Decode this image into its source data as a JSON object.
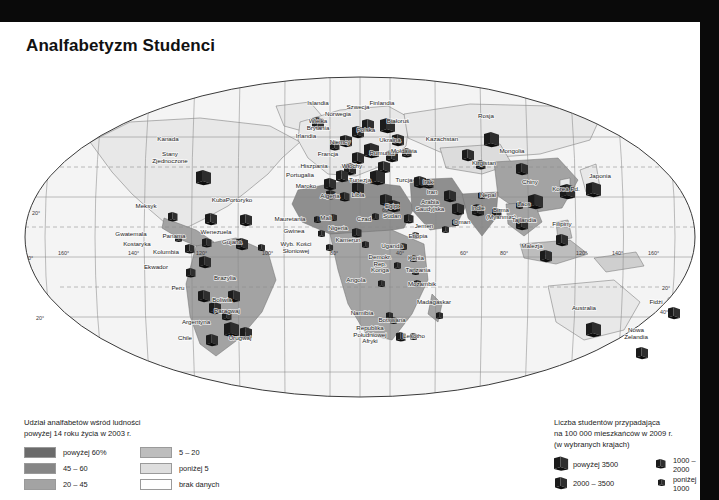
{
  "title": "Analfabetyzm\nStudenci",
  "legend_left": {
    "heading": "Udział analfabetów wśród ludności\npowyżej 14 roku życia w 2003 r.",
    "items": [
      {
        "label": "powyżej 60%",
        "color": "#6b6b6b"
      },
      {
        "label": "45 – 60",
        "color": "#868686"
      },
      {
        "label": "20 – 45",
        "color": "#a3a3a3"
      },
      {
        "label": "5 – 20",
        "color": "#bdbdbd"
      },
      {
        "label": "poniżej 5",
        "color": "#dedede"
      },
      {
        "label": "brak danych",
        "color": "#ffffff"
      }
    ]
  },
  "legend_right": {
    "heading": "Liczba studentów przypadająca\nna 100 000 mieszkańców w 2009 r.\n(w wybranych krajach)",
    "items": [
      {
        "label": "powyżej 3500",
        "size": 15
      },
      {
        "label": "2000 – 3500",
        "size": 12
      },
      {
        "label": "1000 – 2000",
        "size": 9.5
      },
      {
        "label": "poniżej 1000",
        "size": 7
      }
    ]
  },
  "graticule": {
    "latitudes": [
      "20°",
      "0°",
      "20°",
      "40°"
    ],
    "longitudes_west": [
      "160°",
      "140°",
      "120°",
      "100°",
      "80°",
      "60°",
      "40°"
    ],
    "longitudes_east": [
      "0°",
      "20°",
      "40°",
      "60°",
      "80°",
      "100°",
      "120°",
      "140°",
      "160°"
    ]
  },
  "countries": [
    {
      "name": "Kanada",
      "x": 168,
      "y": 119,
      "book": 0,
      "fill": "#e8e8e8"
    },
    {
      "name": "Stany\nZjednoczone",
      "x": 170,
      "y": 134,
      "book": 15,
      "bx": 196,
      "by": 148,
      "fill": "#e8e8e8"
    },
    {
      "name": "Meksyk",
      "x": 146,
      "y": 186,
      "book": 9.5,
      "bx": 168,
      "by": 190,
      "fill": "#a3a3a3"
    },
    {
      "name": "Kuba",
      "x": 219,
      "y": 180,
      "book": 12,
      "bx": 205,
      "by": 191,
      "fill": "#bdbdbd"
    },
    {
      "name": "Portoryko",
      "x": 239,
      "y": 180,
      "book": 12,
      "bx": 240,
      "by": 192,
      "fill": "#bdbdbd"
    },
    {
      "name": "Gwatemala",
      "x": 131,
      "y": 214,
      "book": 7,
      "bx": 175,
      "by": 213,
      "fill": "#a3a3a3"
    },
    {
      "name": "Kostaryka",
      "x": 137,
      "y": 224,
      "book": 9.5,
      "bx": 185,
      "by": 222,
      "fill": "#bdbdbd"
    },
    {
      "name": "Panama",
      "x": 174,
      "y": 216,
      "book": 9.5,
      "bx": 202,
      "by": 216,
      "fill": "#bdbdbd"
    },
    {
      "name": "Wenezuela",
      "x": 216,
      "y": 212,
      "book": 12,
      "bx": 236,
      "by": 216,
      "fill": "#a3a3a3"
    },
    {
      "name": "Gujana",
      "x": 232,
      "y": 222,
      "book": 7,
      "bx": 258,
      "by": 222,
      "fill": "#bdbdbd"
    },
    {
      "name": "Kolumbia",
      "x": 166,
      "y": 232,
      "book": 12,
      "bx": 199,
      "by": 234,
      "fill": "#a3a3a3"
    },
    {
      "name": "Ekwador",
      "x": 156,
      "y": 247,
      "book": 9.5,
      "bx": 186,
      "by": 246,
      "fill": "#a3a3a3"
    },
    {
      "name": "Peru",
      "x": 178,
      "y": 268,
      "book": 12,
      "bx": 198,
      "by": 268,
      "fill": "#a3a3a3"
    },
    {
      "name": "Brazylia",
      "x": 225,
      "y": 258,
      "book": 12,
      "bx": 228,
      "by": 268,
      "fill": "#a3a3a3"
    },
    {
      "name": "Boliwia",
      "x": 222,
      "y": 280,
      "book": 12,
      "bx": 209,
      "by": 280,
      "fill": "#a3a3a3"
    },
    {
      "name": "Paragwaj",
      "x": 227,
      "y": 291,
      "book": 9.5,
      "bx": 222,
      "by": 289,
      "fill": "#bdbdbd"
    },
    {
      "name": "Argentyna",
      "x": 196,
      "y": 302,
      "book": 15,
      "bx": 224,
      "by": 300,
      "fill": "#bdbdbd"
    },
    {
      "name": "Chile",
      "x": 185,
      "y": 318,
      "book": 12,
      "bx": 206,
      "by": 312,
      "fill": "#bdbdbd"
    },
    {
      "name": "Urugwaj",
      "x": 240,
      "y": 318,
      "book": 12,
      "bx": 240,
      "by": 305,
      "fill": "#bdbdbd"
    },
    {
      "name": "Islandia",
      "x": 318,
      "y": 83,
      "book": 12,
      "bx": 312,
      "by": 95,
      "fill": "#e8e8e8"
    },
    {
      "name": "Norwegia",
      "x": 338,
      "y": 94,
      "book": 12,
      "bx": 352,
      "by": 104,
      "fill": "#e8e8e8"
    },
    {
      "name": "Szwecja",
      "x": 358,
      "y": 87,
      "book": 12,
      "bx": 362,
      "by": 97,
      "fill": "#e8e8e8"
    },
    {
      "name": "Finlandia",
      "x": 382,
      "y": 83,
      "book": 15,
      "bx": 380,
      "by": 96,
      "fill": "#e8e8e8"
    },
    {
      "name": "Wielka\nBrytania",
      "x": 318,
      "y": 101,
      "book": 12,
      "bx": 340,
      "by": 113,
      "fill": "#e8e8e8"
    },
    {
      "name": "Irlandia",
      "x": 306,
      "y": 116,
      "book": 9.5,
      "bx": 330,
      "by": 119,
      "fill": "#e8e8e8"
    },
    {
      "name": "Białoruś",
      "x": 398,
      "y": 101,
      "book": 12,
      "bx": 392,
      "by": 112,
      "fill": "#e8e8e8"
    },
    {
      "name": "Polska",
      "x": 366,
      "y": 110,
      "book": 15,
      "bx": 364,
      "by": 121,
      "fill": "#e8e8e8"
    },
    {
      "name": "Niemcy",
      "x": 340,
      "y": 122,
      "book": 12,
      "bx": 352,
      "by": 130,
      "fill": "#e8e8e8"
    },
    {
      "name": "Ukraina",
      "x": 390,
      "y": 120,
      "book": 12,
      "bx": 386,
      "by": 128,
      "fill": "#e8e8e8"
    },
    {
      "name": "Rumunia",
      "x": 382,
      "y": 133,
      "book": 12,
      "bx": 378,
      "by": 139,
      "fill": "#e8e8e8"
    },
    {
      "name": "Mołdawia",
      "x": 404,
      "y": 131,
      "book": 9.5,
      "bx": 402,
      "by": 126,
      "fill": "#e8e8e8"
    },
    {
      "name": "Francja",
      "x": 328,
      "y": 134,
      "book": 12,
      "bx": 344,
      "by": 141,
      "fill": "#e8e8e8"
    },
    {
      "name": "Hiszpania",
      "x": 314,
      "y": 146,
      "book": 12,
      "bx": 336,
      "by": 148,
      "fill": "#e8e8e8"
    },
    {
      "name": "Portugalia",
      "x": 300,
      "y": 155,
      "book": 12,
      "bx": 324,
      "by": 156,
      "fill": "#e8e8e8"
    },
    {
      "name": "Włochy",
      "x": 352,
      "y": 146,
      "book": 15,
      "bx": 370,
      "by": 148,
      "fill": "#e8e8e8"
    },
    {
      "name": "Maroko",
      "x": 306,
      "y": 166,
      "book": 9.5,
      "bx": 326,
      "by": 168,
      "fill": "#868686"
    },
    {
      "name": "Algeria",
      "x": 330,
      "y": 176,
      "book": 9.5,
      "bx": 340,
      "by": 170,
      "fill": "#a3a3a3"
    },
    {
      "name": "Tunezja",
      "x": 360,
      "y": 160,
      "book": 12,
      "bx": 352,
      "by": 160,
      "fill": "#a3a3a3"
    },
    {
      "name": "Libia",
      "x": 358,
      "y": 175,
      "book": 12,
      "bx": 380,
      "by": 172,
      "fill": "#a3a3a3"
    },
    {
      "name": "Egipt",
      "x": 392,
      "y": 186,
      "book": 12,
      "bx": 388,
      "by": 178,
      "fill": "#868686"
    },
    {
      "name": "Sudan",
      "x": 392,
      "y": 196,
      "book": 9.5,
      "bx": 404,
      "by": 192,
      "fill": "#6b6b6b"
    },
    {
      "name": "Czad",
      "x": 364,
      "y": 199,
      "book": 7,
      "bx": 372,
      "by": 191,
      "fill": "#6b6b6b"
    },
    {
      "name": "Mauretania",
      "x": 290,
      "y": 199,
      "book": 7,
      "bx": 314,
      "by": 194,
      "fill": "#6b6b6b"
    },
    {
      "name": "Mali",
      "x": 326,
      "y": 198,
      "book": 7,
      "bx": 330,
      "by": 192,
      "fill": "#6b6b6b"
    },
    {
      "name": "Gwinea",
      "x": 294,
      "y": 211,
      "book": 7,
      "bx": 318,
      "by": 208,
      "fill": "#6b6b6b"
    },
    {
      "name": "Wyb. Kości\nSłoniowej",
      "x": 296,
      "y": 224,
      "book": 7,
      "bx": 326,
      "by": 222,
      "fill": "#6b6b6b"
    },
    {
      "name": "Nigeria",
      "x": 338,
      "y": 208,
      "book": 9.5,
      "bx": 352,
      "by": 206,
      "fill": "#a3a3a3"
    },
    {
      "name": "Kamerun",
      "x": 348,
      "y": 220,
      "book": 7,
      "bx": 362,
      "by": 219,
      "fill": "#868686"
    },
    {
      "name": "Uganda",
      "x": 392,
      "y": 226,
      "book": 7,
      "bx": 400,
      "by": 221,
      "fill": "#868686"
    },
    {
      "name": "Demokr.\nRep.\nKonga",
      "x": 380,
      "y": 237,
      "book": 7,
      "bx": 394,
      "by": 240,
      "fill": "#a3a3a3"
    },
    {
      "name": "Kenia",
      "x": 416,
      "y": 238,
      "book": 7,
      "bx": 410,
      "by": 233,
      "fill": "#868686"
    },
    {
      "name": "Etiopia",
      "x": 418,
      "y": 216,
      "book": 7,
      "bx": 412,
      "by": 210,
      "fill": "#6b6b6b"
    },
    {
      "name": "Tanzania",
      "x": 418,
      "y": 250,
      "book": 7,
      "bx": 412,
      "by": 246,
      "fill": "#a3a3a3"
    },
    {
      "name": "Mozambik",
      "x": 422,
      "y": 264,
      "book": 7,
      "bx": 414,
      "by": 258,
      "fill": "#6b6b6b"
    },
    {
      "name": "Angola",
      "x": 356,
      "y": 260,
      "book": 7,
      "bx": 378,
      "by": 258,
      "fill": "#868686"
    },
    {
      "name": "Madagaskar",
      "x": 434,
      "y": 282,
      "book": 7,
      "bx": 436,
      "by": 290,
      "fill": "#a3a3a3"
    },
    {
      "name": "Namibia",
      "x": 362,
      "y": 293,
      "book": 7,
      "bx": 386,
      "by": 290,
      "fill": "#a3a3a3"
    },
    {
      "name": "Botswana",
      "x": 392,
      "y": 300,
      "book": 7,
      "bx": 390,
      "by": 295,
      "fill": "#a3a3a3"
    },
    {
      "name": "Republika\nPołudniowej\nAfryki",
      "x": 370,
      "y": 308,
      "book": 9.5,
      "bx": 396,
      "by": 310,
      "fill": "#a3a3a3"
    },
    {
      "name": "Lesotho",
      "x": 414,
      "y": 316,
      "book": 7,
      "bx": 410,
      "by": 311,
      "fill": "#a3a3a3"
    },
    {
      "name": "Turcja",
      "x": 404,
      "y": 160,
      "book": 12,
      "bx": 414,
      "by": 154,
      "fill": "#bdbdbd"
    },
    {
      "name": "Irak",
      "x": 428,
      "y": 162,
      "book": 9.5,
      "bx": 424,
      "by": 157,
      "fill": "#a3a3a3"
    },
    {
      "name": "Iran",
      "x": 432,
      "y": 172,
      "book": 12,
      "bx": 444,
      "by": 168,
      "fill": "#a3a3a3"
    },
    {
      "name": "Arabia\nSaudyjska",
      "x": 430,
      "y": 182,
      "book": 12,
      "bx": 452,
      "by": 181,
      "fill": "#868686"
    },
    {
      "name": "Jemen",
      "x": 424,
      "y": 206,
      "book": 7,
      "bx": 442,
      "by": 204,
      "fill": "#6b6b6b"
    },
    {
      "name": "Oman",
      "x": 462,
      "y": 202,
      "book": 7,
      "bx": 452,
      "by": 197,
      "fill": "#868686"
    },
    {
      "name": "Kazachstan",
      "x": 442,
      "y": 119,
      "book": 12,
      "bx": 462,
      "by": 127,
      "fill": "#e8e8e8"
    },
    {
      "name": "Rosja",
      "x": 486,
      "y": 96,
      "book": 15,
      "bx": 484,
      "by": 110,
      "fill": "#e8e8e8"
    },
    {
      "name": "Mongolia",
      "x": 512,
      "y": 131,
      "book": 12,
      "bx": 516,
      "by": 141,
      "fill": "#bdbdbd"
    },
    {
      "name": "Kirgistan",
      "x": 484,
      "y": 143,
      "book": 9.5,
      "bx": 476,
      "by": 138,
      "fill": "#bdbdbd"
    },
    {
      "name": "Chiny",
      "x": 530,
      "y": 162,
      "book": 15,
      "bx": 528,
      "by": 172,
      "fill": "#a3a3a3"
    },
    {
      "name": "Indie",
      "x": 478,
      "y": 188,
      "book": 12,
      "bx": 472,
      "by": 182,
      "fill": "#868686"
    },
    {
      "name": "Nepal",
      "x": 488,
      "y": 175,
      "book": 7,
      "bx": 478,
      "by": 170,
      "fill": "#6b6b6b"
    },
    {
      "name": "Birma\n(Myanmar)",
      "x": 501,
      "y": 190,
      "book": 9.5,
      "bx": 492,
      "by": 186,
      "fill": "#a3a3a3"
    },
    {
      "name": "Laos",
      "x": 524,
      "y": 184,
      "book": 7,
      "bx": 516,
      "by": 180,
      "fill": "#868686"
    },
    {
      "name": "Tajlandia",
      "x": 524,
      "y": 200,
      "book": 12,
      "bx": 516,
      "by": 196,
      "fill": "#bdbdbd"
    },
    {
      "name": "Malezja",
      "x": 532,
      "y": 226,
      "book": 12,
      "bx": 540,
      "by": 228,
      "fill": "#bdbdbd"
    },
    {
      "name": "Filipiny",
      "x": 562,
      "y": 204,
      "book": 12,
      "bx": 556,
      "by": 212,
      "fill": "#bdbdbd"
    },
    {
      "name": "Japonia",
      "x": 600,
      "y": 156,
      "book": 15,
      "bx": 586,
      "by": 160,
      "fill": "#e8e8e8"
    },
    {
      "name": "Korea Pd.",
      "x": 566,
      "y": 169,
      "book": 15,
      "bx": 560,
      "by": 162,
      "fill": "#e8e8e8"
    },
    {
      "name": "Australia",
      "x": 584,
      "y": 288,
      "book": 15,
      "bx": 586,
      "by": 300,
      "fill": "#e8e8e8"
    },
    {
      "name": "Nowa\nZelandia",
      "x": 636,
      "y": 310,
      "book": 12,
      "bx": 636,
      "by": 325,
      "fill": "#e8e8e8"
    },
    {
      "name": "Fidżi",
      "x": 656,
      "y": 282,
      "book": 12,
      "bx": 668,
      "by": 285,
      "fill": "#e8e8e8"
    }
  ]
}
